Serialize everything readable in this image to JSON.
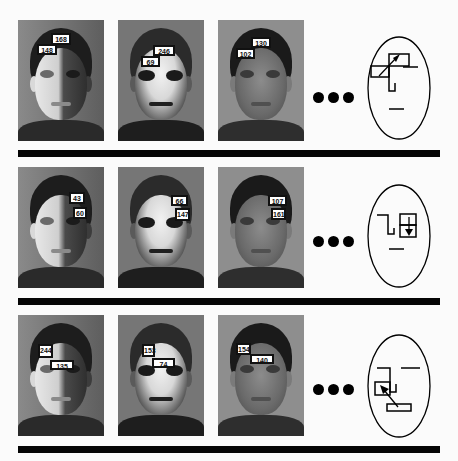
{
  "figure": {
    "rows": [
      {
        "feature": "forehead-vs-left-eye",
        "photos": [
          {
            "lighting": "left-lit",
            "labels": [
              {
                "value": "168",
                "x": 33,
                "y": 13,
                "w": 20,
                "h": 10
              },
              {
                "value": "148",
                "x": 19,
                "y": 23,
                "w": 20,
                "h": 10
              }
            ]
          },
          {
            "lighting": "center-lit",
            "labels": [
              {
                "value": "246",
                "x": 35,
                "y": 25,
                "w": 22,
                "h": 10
              },
              {
                "value": "69",
                "x": 23,
                "y": 36,
                "w": 19,
                "h": 10
              }
            ]
          },
          {
            "lighting": "dim",
            "labels": [
              {
                "value": "130",
                "x": 33,
                "y": 17,
                "w": 20,
                "h": 10
              },
              {
                "value": "102",
                "x": 18,
                "y": 28,
                "w": 19,
                "h": 10
              }
            ]
          }
        ],
        "ellipsis": "•••",
        "schematic": "two-box-diagonal-arrow-up-right"
      },
      {
        "feature": "right-eye-vs-cheek",
        "photos": [
          {
            "lighting": "left-lit",
            "labels": [
              {
                "value": "43",
                "x": 51,
                "y": 26,
                "w": 16,
                "h": 10
              },
              {
                "value": "60",
                "x": 55,
                "y": 40,
                "w": 14,
                "h": 11
              }
            ]
          },
          {
            "lighting": "center-lit",
            "labels": [
              {
                "value": "66",
                "x": 53,
                "y": 28,
                "w": 17,
                "h": 10
              },
              {
                "value": "147",
                "x": 57,
                "y": 41,
                "w": 14,
                "h": 12
              }
            ]
          },
          {
            "lighting": "dim",
            "labels": [
              {
                "value": "107",
                "x": 50,
                "y": 28,
                "w": 19,
                "h": 10
              },
              {
                "value": "161",
                "x": 53,
                "y": 41,
                "w": 15,
                "h": 11
              }
            ]
          }
        ],
        "ellipsis": "•••",
        "schematic": "two-box-vertical-arrow-down"
      },
      {
        "feature": "left-cheek-vs-mouth",
        "photos": [
          {
            "lighting": "left-lit",
            "labels": [
              {
                "value": "244",
                "x": 20,
                "y": 29,
                "w": 15,
                "h": 13
              },
              {
                "value": "135",
                "x": 32,
                "y": 45,
                "w": 24,
                "h": 8
              }
            ]
          },
          {
            "lighting": "center-lit",
            "labels": [
              {
                "value": "153",
                "x": 24,
                "y": 29,
                "w": 13,
                "h": 12
              },
              {
                "value": "74",
                "x": 34,
                "y": 43,
                "w": 23,
                "h": 9
              }
            ]
          },
          {
            "lighting": "dim",
            "labels": [
              {
                "value": "154",
                "x": 18,
                "y": 28,
                "w": 15,
                "h": 11
              },
              {
                "value": "140",
                "x": 32,
                "y": 39,
                "w": 24,
                "h": 9
              }
            ]
          }
        ],
        "ellipsis": "•••",
        "schematic": "two-box-diagonal-arrow-up-left"
      }
    ],
    "colors": {
      "bar": "#050505",
      "label_bg": "#ffffff",
      "label_border": "#111111",
      "background": "#fbfbfb"
    }
  }
}
